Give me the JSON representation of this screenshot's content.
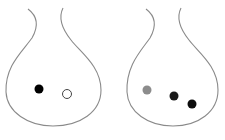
{
  "diagram": {
    "stroke_color": "#8a8a8a",
    "flasks": [
      {
        "name": "flask-left",
        "particles": [
          {
            "type": "filled",
            "color": "#000000",
            "cx": 39,
            "cy": 89,
            "r": 4.5
          },
          {
            "type": "hollow",
            "color": "#ffffff",
            "stroke": "#444444",
            "cx": 67,
            "cy": 94,
            "r": 4.5
          }
        ]
      },
      {
        "name": "flask-right",
        "particles": [
          {
            "type": "filled",
            "color": "#8c8c8c",
            "cx": 147,
            "cy": 90,
            "r": 4.5
          },
          {
            "type": "filled",
            "color": "#1a1a1a",
            "cx": 174,
            "cy": 96,
            "r": 4.5
          },
          {
            "type": "filled",
            "color": "#0d0d0d",
            "cx": 192,
            "cy": 104,
            "r": 4.5
          }
        ]
      }
    ]
  }
}
